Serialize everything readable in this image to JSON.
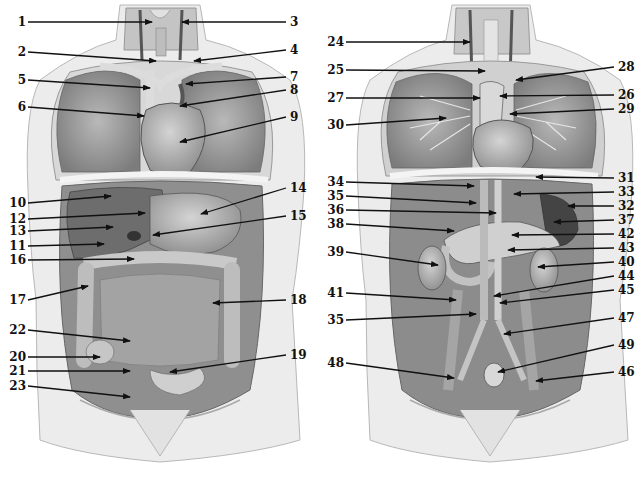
{
  "figures": [
    {
      "id": "left",
      "view": "anterior-thoracic-abdominal-organs",
      "labels": [
        {
          "n": "1",
          "side": "l",
          "lx": 22,
          "ly": 22,
          "tx": 152,
          "ty": 22
        },
        {
          "n": "2",
          "side": "l",
          "lx": 22,
          "ly": 52,
          "tx": 156,
          "ty": 61
        },
        {
          "n": "3",
          "side": "r",
          "lx": 290,
          "ly": 22,
          "tx": 182,
          "ty": 22
        },
        {
          "n": "4",
          "side": "r",
          "lx": 290,
          "ly": 50,
          "tx": 194,
          "ty": 61
        },
        {
          "n": "5",
          "side": "l",
          "lx": 22,
          "ly": 80,
          "tx": 150,
          "ty": 88
        },
        {
          "n": "6",
          "side": "l",
          "lx": 22,
          "ly": 107,
          "tx": 144,
          "ty": 116
        },
        {
          "n": "7",
          "side": "r",
          "lx": 290,
          "ly": 77,
          "tx": 186,
          "ty": 84
        },
        {
          "n": "8",
          "side": "r",
          "lx": 290,
          "ly": 90,
          "tx": 180,
          "ty": 106
        },
        {
          "n": "9",
          "side": "r",
          "lx": 290,
          "ly": 117,
          "tx": 180,
          "ty": 142
        },
        {
          "n": "10",
          "side": "l",
          "lx": 22,
          "ly": 203,
          "tx": 111,
          "ty": 196
        },
        {
          "n": "12",
          "side": "l",
          "lx": 22,
          "ly": 219,
          "tx": 145,
          "ty": 213
        },
        {
          "n": "13",
          "side": "l",
          "lx": 22,
          "ly": 231,
          "tx": 113,
          "ty": 227
        },
        {
          "n": "11",
          "side": "l",
          "lx": 22,
          "ly": 246,
          "tx": 104,
          "ty": 244
        },
        {
          "n": "16",
          "side": "l",
          "lx": 22,
          "ly": 260,
          "tx": 134,
          "ty": 259
        },
        {
          "n": "14",
          "side": "r",
          "lx": 290,
          "ly": 188,
          "tx": 201,
          "ty": 214
        },
        {
          "n": "15",
          "side": "r",
          "lx": 290,
          "ly": 216,
          "tx": 153,
          "ty": 235
        },
        {
          "n": "17",
          "side": "l",
          "lx": 22,
          "ly": 300,
          "tx": 88,
          "ty": 286
        },
        {
          "n": "18",
          "side": "r",
          "lx": 290,
          "ly": 300,
          "tx": 213,
          "ty": 303
        },
        {
          "n": "22",
          "side": "l",
          "lx": 22,
          "ly": 330,
          "tx": 130,
          "ty": 341
        },
        {
          "n": "20",
          "side": "l",
          "lx": 22,
          "ly": 357,
          "tx": 100,
          "ty": 357
        },
        {
          "n": "21",
          "side": "l",
          "lx": 22,
          "ly": 371,
          "tx": 130,
          "ty": 371
        },
        {
          "n": "19",
          "side": "r",
          "lx": 290,
          "ly": 355,
          "tx": 170,
          "ty": 372
        },
        {
          "n": "23",
          "side": "l",
          "lx": 22,
          "ly": 386,
          "tx": 130,
          "ty": 397
        }
      ]
    },
    {
      "id": "right",
      "view": "anterior-deep-structures-vessels-kidneys",
      "labels": [
        {
          "n": "24",
          "side": "l",
          "lx": 340,
          "ly": 42,
          "tx": 470,
          "ty": 42
        },
        {
          "n": "25",
          "side": "l",
          "lx": 340,
          "ly": 70,
          "tx": 485,
          "ty": 71
        },
        {
          "n": "27",
          "side": "l",
          "lx": 340,
          "ly": 98,
          "tx": 480,
          "ty": 98
        },
        {
          "n": "30",
          "side": "l",
          "lx": 340,
          "ly": 125,
          "tx": 446,
          "ty": 118
        },
        {
          "n": "28",
          "side": "r",
          "lx": 618,
          "ly": 67,
          "tx": 516,
          "ty": 80
        },
        {
          "n": "26",
          "side": "r",
          "lx": 618,
          "ly": 95,
          "tx": 500,
          "ty": 96
        },
        {
          "n": "29",
          "side": "r",
          "lx": 618,
          "ly": 109,
          "tx": 510,
          "ty": 114
        },
        {
          "n": "34",
          "side": "l",
          "lx": 340,
          "ly": 182,
          "tx": 474,
          "ty": 186
        },
        {
          "n": "35",
          "side": "l",
          "lx": 340,
          "ly": 196,
          "tx": 476,
          "ty": 203
        },
        {
          "n": "36",
          "side": "l",
          "lx": 340,
          "ly": 210,
          "tx": 496,
          "ty": 213
        },
        {
          "n": "38",
          "side": "l",
          "lx": 340,
          "ly": 224,
          "tx": 454,
          "ty": 231
        },
        {
          "n": "39",
          "side": "l",
          "lx": 340,
          "ly": 252,
          "tx": 438,
          "ty": 265
        },
        {
          "n": "31",
          "side": "r",
          "lx": 618,
          "ly": 178,
          "tx": 536,
          "ty": 177
        },
        {
          "n": "33",
          "side": "r",
          "lx": 618,
          "ly": 192,
          "tx": 514,
          "ty": 194
        },
        {
          "n": "32",
          "side": "r",
          "lx": 618,
          "ly": 206,
          "tx": 568,
          "ty": 206
        },
        {
          "n": "37",
          "side": "r",
          "lx": 618,
          "ly": 220,
          "tx": 554,
          "ty": 222
        },
        {
          "n": "42",
          "side": "r",
          "lx": 618,
          "ly": 234,
          "tx": 512,
          "ty": 235
        },
        {
          "n": "43",
          "side": "r",
          "lx": 618,
          "ly": 248,
          "tx": 508,
          "ty": 250
        },
        {
          "n": "40",
          "side": "r",
          "lx": 618,
          "ly": 262,
          "tx": 538,
          "ty": 267
        },
        {
          "n": "44",
          "side": "r",
          "lx": 618,
          "ly": 276,
          "tx": 494,
          "ty": 296
        },
        {
          "n": "45",
          "side": "r",
          "lx": 618,
          "ly": 290,
          "tx": 500,
          "ty": 303
        },
        {
          "n": "41",
          "side": "l",
          "lx": 340,
          "ly": 293,
          "tx": 456,
          "ty": 300
        },
        {
          "n": "35",
          "side": "l",
          "lx": 340,
          "ly": 320,
          "tx": 476,
          "ty": 314
        },
        {
          "n": "47",
          "side": "r",
          "lx": 618,
          "ly": 318,
          "tx": 504,
          "ty": 334
        },
        {
          "n": "49",
          "side": "r",
          "lx": 618,
          "ly": 345,
          "tx": 498,
          "ty": 372
        },
        {
          "n": "48",
          "side": "l",
          "lx": 340,
          "ly": 363,
          "tx": 454,
          "ty": 378
        },
        {
          "n": "46",
          "side": "r",
          "lx": 618,
          "ly": 372,
          "tx": 536,
          "ty": 381
        }
      ]
    }
  ],
  "colors": {
    "ink": "#111111",
    "skin": "#ececec",
    "skin_edge": "#9a9a9a",
    "cavity": "#8a8a8a",
    "organ_dark": "#6e6e6e",
    "organ_mid": "#a9a9a9",
    "organ_light": "#cfcfcf"
  }
}
